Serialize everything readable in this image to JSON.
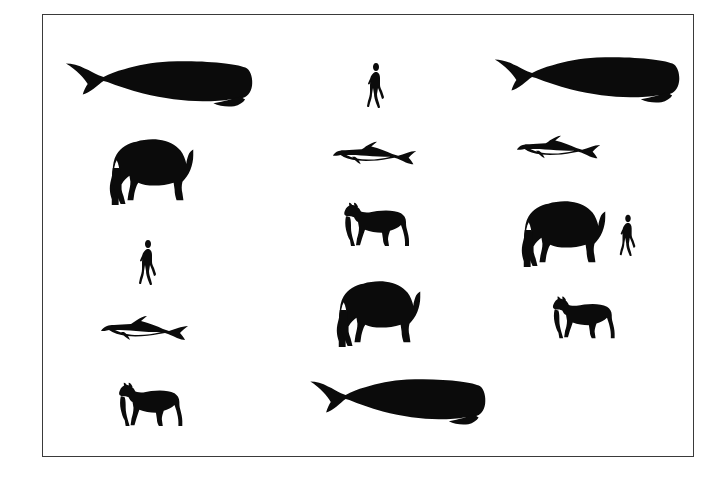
{
  "figure": {
    "background_color": "#ffffff",
    "silhouette_color": "#0b0b0b",
    "frame_color": "#3a3a3a",
    "frame": {
      "x": 42,
      "y": 14,
      "width": 652,
      "height": 443,
      "border_px": 1.5
    },
    "canvas": {
      "width": 726,
      "height": 485
    }
  },
  "legend_counts": {
    "sperm_whale": 3,
    "elephant": 3,
    "dolphin": 3,
    "horse": 3,
    "human": 3
  },
  "silhouettes": [
    {
      "id": "sperm-whale-top-left",
      "species": "sperm whale",
      "facing": "right",
      "x": 55,
      "y": 48,
      "width": 198,
      "height": 62
    },
    {
      "id": "elephant-upper-left",
      "species": "elephant",
      "facing": "left",
      "x": 98,
      "y": 128,
      "width": 108,
      "height": 80
    },
    {
      "id": "human-left",
      "species": "human",
      "facing": "right",
      "x": 135,
      "y": 237,
      "width": 24,
      "height": 48
    },
    {
      "id": "dolphin-lower-left",
      "species": "dolphin",
      "facing": "left",
      "x": 98,
      "y": 310,
      "width": 96,
      "height": 34
    },
    {
      "id": "horse-bottom-left",
      "species": "horse",
      "facing": "left",
      "x": 112,
      "y": 376,
      "width": 82,
      "height": 52
    },
    {
      "id": "human-top-center",
      "species": "human",
      "facing": "right",
      "x": 363,
      "y": 60,
      "width": 24,
      "height": 48
    },
    {
      "id": "dolphin-upper-center",
      "species": "dolphin",
      "facing": "left",
      "x": 330,
      "y": 136,
      "width": 92,
      "height": 32
    },
    {
      "id": "horse-center",
      "species": "horse",
      "facing": "left",
      "x": 337,
      "y": 196,
      "width": 84,
      "height": 52
    },
    {
      "id": "elephant-center",
      "species": "elephant",
      "facing": "left",
      "x": 325,
      "y": 270,
      "width": 108,
      "height": 80
    },
    {
      "id": "sperm-whale-bottom",
      "species": "sperm whale",
      "facing": "right",
      "x": 300,
      "y": 366,
      "width": 186,
      "height": 62
    },
    {
      "id": "sperm-whale-top-right",
      "species": "sperm whale",
      "facing": "right",
      "x": 484,
      "y": 44,
      "width": 196,
      "height": 62
    },
    {
      "id": "dolphin-upper-right",
      "species": "dolphin",
      "facing": "left",
      "x": 514,
      "y": 130,
      "width": 92,
      "height": 32
    },
    {
      "id": "elephant-right",
      "species": "elephant",
      "facing": "left",
      "x": 510,
      "y": 190,
      "width": 108,
      "height": 80
    },
    {
      "id": "human-right",
      "species": "human",
      "facing": "right",
      "x": 616,
      "y": 212,
      "width": 22,
      "height": 44
    },
    {
      "id": "horse-right",
      "species": "horse",
      "facing": "left",
      "x": 546,
      "y": 290,
      "width": 80,
      "height": 50
    }
  ]
}
